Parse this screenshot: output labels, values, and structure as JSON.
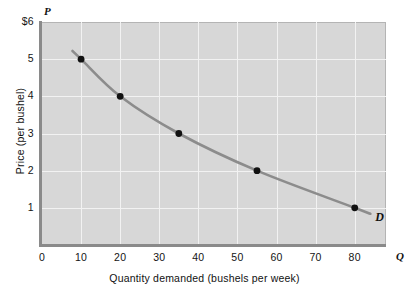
{
  "chart_data": {
    "type": "line",
    "title": "",
    "subtitle": "",
    "xlabel": "Quantity demanded (bushels per week)",
    "ylabel": "Price (per bushel)",
    "x_axis_variable": "Q",
    "y_axis_variable": "P",
    "xlim": [
      0,
      88
    ],
    "ylim": [
      0,
      6
    ],
    "grid": true,
    "legend_position": "inline-end-of-curve",
    "xticks": [
      {
        "value": 0,
        "label": "0"
      },
      {
        "value": 10,
        "label": "10"
      },
      {
        "value": 20,
        "label": "20"
      },
      {
        "value": 30,
        "label": "30"
      },
      {
        "value": 40,
        "label": "40"
      },
      {
        "value": 50,
        "label": "50"
      },
      {
        "value": 60,
        "label": "60"
      },
      {
        "value": 70,
        "label": "70"
      },
      {
        "value": 80,
        "label": "80"
      }
    ],
    "yticks": [
      {
        "value": 6,
        "label": "$6"
      },
      {
        "value": 5,
        "label": "5"
      },
      {
        "value": 4,
        "label": "4"
      },
      {
        "value": 3,
        "label": "3"
      },
      {
        "value": 2,
        "label": "2"
      },
      {
        "value": 1,
        "label": "1"
      }
    ],
    "series": [
      {
        "name": "D",
        "annotation": "D",
        "color": "#8c8c8c",
        "marker_color": "#111111",
        "points": [
          {
            "x": 10,
            "y": 5
          },
          {
            "x": 20,
            "y": 4
          },
          {
            "x": 35,
            "y": 3
          },
          {
            "x": 55,
            "y": 2
          },
          {
            "x": 80,
            "y": 1
          }
        ]
      }
    ],
    "colors": {
      "plot_background": "#d7d7d7",
      "gridline": "#f2f2f2",
      "axis": "#8a8a8a",
      "curve": "#8c8c8c",
      "marker": "#111111",
      "text": "#111111",
      "page_background": "#ffffff"
    }
  }
}
